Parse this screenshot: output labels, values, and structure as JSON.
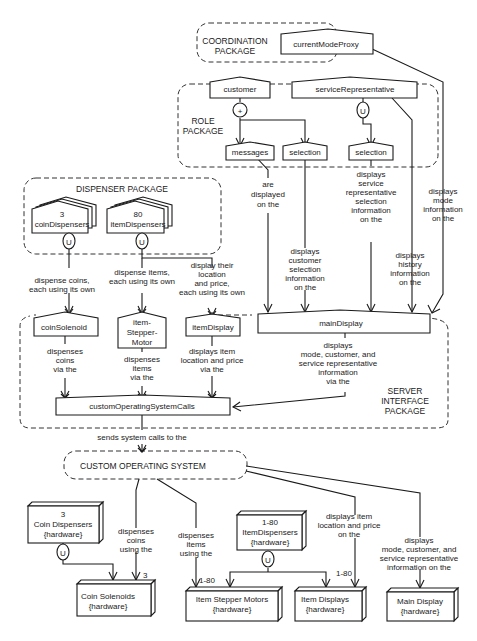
{
  "packages": {
    "coordination": [
      "COORDINATION",
      "PACKAGE"
    ],
    "role": [
      "ROLE",
      "PACKAGE"
    ],
    "dispenser": "DISPENSER PACKAGE",
    "server_interface": [
      "SERVER",
      "INTERFACE",
      "PACKAGE"
    ],
    "custom_os": "CUSTOM OPERATING SYSTEM"
  },
  "nodes": {
    "currentModeProxy": "currentModeProxy",
    "customer": "customer",
    "serviceRepresentative": "serviceRepresentative",
    "messages": "messages",
    "customer_selection": "selection",
    "service_selection": "selection",
    "coinDispensers": [
      "3",
      "coinDispensers"
    ],
    "itemDispensers": [
      "80",
      "itemDispensers"
    ],
    "coinSolenoid": "coinSolenoid",
    "itemStepperMotor": [
      "item-",
      "Stepper-",
      "Motor"
    ],
    "itemDisplay": "itemDisplay",
    "mainDisplay": "mainDisplay",
    "customOperatingSystemCalls": "customOperatingSystemCalls"
  },
  "hardware": {
    "coin_dispensers": [
      "3",
      "Coin Dispensers",
      "{hardware}"
    ],
    "coin_solenoids": [
      "Coin Solenoids",
      "{hardware}"
    ],
    "item_dispensers": [
      "1-80",
      "ItemDispensers",
      "{hardware}"
    ],
    "item_stepper_motors": [
      "Item Stepper Motors",
      "{hardware}"
    ],
    "item_displays": [
      "Item Displays",
      "{hardware}"
    ],
    "main_display": [
      "Main Display",
      "{hardware}"
    ]
  },
  "symbols": {
    "customer_aggregation": "+",
    "service_union": "U",
    "coin_union": "U",
    "item_union": "U",
    "hw_coin_union": "U",
    "hw_item_union": "U"
  },
  "edge_labels": {
    "messages_displayed": [
      "are",
      "displayed",
      "on the"
    ],
    "customer_selection": [
      "displays",
      "customer",
      "selection",
      "information",
      "on the"
    ],
    "service_selection": [
      "displays",
      "service",
      "representative",
      "selection",
      "information",
      "on the"
    ],
    "history": [
      "displays",
      "history",
      "information",
      "on the"
    ],
    "mode": [
      "displays",
      "mode",
      "information",
      "on the"
    ],
    "dispense_coins": [
      "dispense coins,",
      "each using its own"
    ],
    "dispense_items": [
      "dispense items,",
      "each using its own"
    ],
    "display_location": [
      "display their",
      "location",
      "and price,",
      "each using its own"
    ],
    "coin_via": [
      "dispenses",
      "coins",
      "via the"
    ],
    "items_via": [
      "dispenses",
      "items",
      "via the"
    ],
    "display_via": [
      "displays item",
      "location and price",
      "via the"
    ],
    "main_via": [
      "displays",
      "mode, customer, and",
      "service representative",
      "information",
      "via the"
    ],
    "sends_calls": "sends system calls to the",
    "hw_coins": [
      "dispenses",
      "coins",
      "using the"
    ],
    "hw_items": [
      "dispenses",
      "items",
      "using the"
    ],
    "hw_display_item": [
      "displays item",
      "location and price",
      "on the"
    ],
    "hw_main": [
      "displays",
      "mode, customer, and",
      "service representative",
      "information on the"
    ]
  },
  "multiplicities": {
    "coin_solenoids": "3",
    "stepper_motors": "1-80",
    "item_displays": "1-80"
  }
}
